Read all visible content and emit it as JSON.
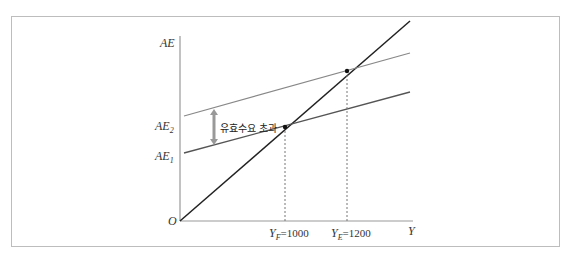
{
  "diagram": {
    "axes": {
      "y_label": "AE",
      "x_label": "Y",
      "origin": "O"
    },
    "curves": [
      {
        "name": "45-degree line",
        "color": "#222222"
      },
      {
        "name": "AE2",
        "label_main": "AE",
        "label_sub": "2",
        "color": "#888888"
      },
      {
        "name": "AE1",
        "label_main": "AE",
        "label_sub": "1",
        "color": "#555555"
      }
    ],
    "annotation": "유효수요 초과",
    "x_ticks": [
      {
        "main": "Y",
        "sub": "F",
        "value": "=1000"
      },
      {
        "main": "Y",
        "sub": "E",
        "value": "=1200"
      }
    ]
  }
}
